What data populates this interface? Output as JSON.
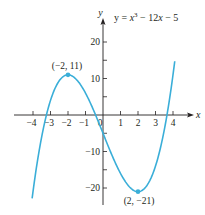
{
  "chart_data": {
    "type": "line",
    "equation_parts": {
      "lhs": "y = x",
      "exp": "3",
      "rhs": " − 12x  −  5"
    },
    "xlabel": "x",
    "ylabel": "y",
    "xlim": [
      -4.3,
      4.5
    ],
    "ylim": [
      -24,
      25
    ],
    "x_ticks": [
      -4,
      -3,
      -2,
      -1,
      0,
      1,
      2,
      3,
      4
    ],
    "x_tick_labels": [
      "−4",
      "−3",
      "−2",
      "−1",
      "0",
      "1",
      "2",
      "3",
      "4"
    ],
    "y_ticks": [
      -20,
      -15,
      -10,
      -5,
      5,
      10,
      15,
      20
    ],
    "y_tick_labels": {
      "20": "20",
      "10": "10",
      "-10": "−10",
      "-20": "−20"
    },
    "grid": false,
    "series": [
      {
        "name": "y = x^3 - 12x - 5",
        "color": "#3aaed8",
        "function": "x^3 - 12x - 5",
        "x_range": [
          -4.05,
          4.1
        ]
      }
    ],
    "annotations": [
      {
        "point": [
          -2,
          11
        ],
        "label": "(−2, 11)",
        "kind": "local maximum"
      },
      {
        "point": [
          2,
          -21
        ],
        "label": "(2, −21)",
        "kind": "local minimum"
      }
    ]
  },
  "colors": {
    "curve": "#3aaed8",
    "axis": "#231f20",
    "text": "#231f20"
  }
}
